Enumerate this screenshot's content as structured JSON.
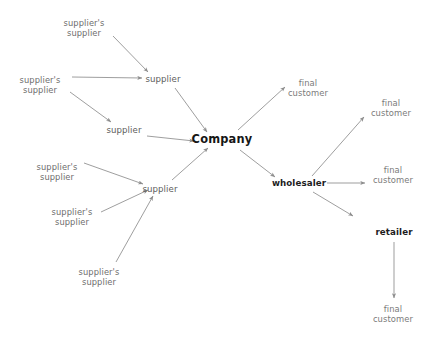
{
  "diagram": {
    "canvas": {
      "width": 430,
      "height": 337,
      "background": "#ffffff"
    },
    "colors": {
      "edge": "#8d8d8d",
      "upstream_text": "#6e6e6e",
      "supplier_text": "#5d5d5d",
      "hub_text": "#161616",
      "mid_text": "#1d1d1d",
      "customer_text": "#7a7a7a"
    },
    "nodes": [
      {
        "id": "ss1",
        "line1": "supplier's",
        "line2": "supplier",
        "x": 84,
        "y": 28,
        "tier": "upstream"
      },
      {
        "id": "ss2",
        "line1": "supplier's",
        "line2": "supplier",
        "x": 40,
        "y": 85,
        "tier": "upstream"
      },
      {
        "id": "ss3",
        "line1": "supplier's",
        "line2": "supplier",
        "x": 57,
        "y": 172,
        "tier": "upstream"
      },
      {
        "id": "ss4",
        "line1": "supplier's",
        "line2": "supplier",
        "x": 72,
        "y": 217,
        "tier": "upstream"
      },
      {
        "id": "ss5",
        "line1": "supplier's",
        "line2": "supplier",
        "x": 99,
        "y": 277,
        "tier": "upstream"
      },
      {
        "id": "s1",
        "line1": "supplier",
        "line2": "",
        "x": 163,
        "y": 79,
        "tier": "supplier"
      },
      {
        "id": "s2",
        "line1": "supplier",
        "line2": "",
        "x": 124,
        "y": 130,
        "tier": "supplier"
      },
      {
        "id": "s3",
        "line1": "supplier",
        "line2": "",
        "x": 160,
        "y": 189,
        "tier": "supplier"
      },
      {
        "id": "co",
        "line1": "Company",
        "line2": "",
        "x": 222,
        "y": 140,
        "tier": "hub"
      },
      {
        "id": "fc1",
        "line1": "final",
        "line2": "customer",
        "x": 308,
        "y": 88,
        "tier": "customer"
      },
      {
        "id": "wh",
        "line1": "wholesaler",
        "line2": "",
        "x": 299,
        "y": 183,
        "tier": "mid"
      },
      {
        "id": "fc2",
        "line1": "final",
        "line2": "customer",
        "x": 391,
        "y": 108,
        "tier": "customer"
      },
      {
        "id": "fc3",
        "line1": "final",
        "line2": "customer",
        "x": 393,
        "y": 175,
        "tier": "customer"
      },
      {
        "id": "rt",
        "line1": "retailer",
        "line2": "",
        "x": 394,
        "y": 232,
        "tier": "mid"
      },
      {
        "id": "fc4",
        "line1": "final",
        "line2": "customer",
        "x": 393,
        "y": 314,
        "tier": "customer"
      }
    ],
    "edges": [
      {
        "id": "e1",
        "from": "ss1",
        "to": "s1",
        "x1": 113,
        "y1": 36,
        "x2": 148,
        "y2": 72
      },
      {
        "id": "e2",
        "from": "ss2",
        "to": "s1",
        "x1": 72,
        "y1": 77,
        "x2": 142,
        "y2": 78
      },
      {
        "id": "e3",
        "from": "ss2",
        "to": "s2",
        "x1": 70,
        "y1": 92,
        "x2": 111,
        "y2": 122
      },
      {
        "id": "e4",
        "from": "s1",
        "to": "co",
        "x1": 175,
        "y1": 88,
        "x2": 207,
        "y2": 132
      },
      {
        "id": "e5",
        "from": "s2",
        "to": "co",
        "x1": 147,
        "y1": 136,
        "x2": 194,
        "y2": 141
      },
      {
        "id": "e6",
        "from": "ss3",
        "to": "s3",
        "x1": 84,
        "y1": 163,
        "x2": 143,
        "y2": 184
      },
      {
        "id": "e7",
        "from": "ss4",
        "to": "s3",
        "x1": 101,
        "y1": 212,
        "x2": 148,
        "y2": 190
      },
      {
        "id": "e8",
        "from": "ss5",
        "to": "s3",
        "x1": 116,
        "y1": 262,
        "x2": 153,
        "y2": 196
      },
      {
        "id": "e9",
        "from": "s3",
        "to": "co",
        "x1": 172,
        "y1": 180,
        "x2": 208,
        "y2": 148
      },
      {
        "id": "e10",
        "from": "co",
        "to": "fc1",
        "x1": 238,
        "y1": 130,
        "x2": 285,
        "y2": 87
      },
      {
        "id": "e11",
        "from": "co",
        "to": "wh",
        "x1": 240,
        "y1": 150,
        "x2": 275,
        "y2": 177
      },
      {
        "id": "e12",
        "from": "wh",
        "to": "fc2",
        "x1": 312,
        "y1": 176,
        "x2": 364,
        "y2": 117
      },
      {
        "id": "e13",
        "from": "wh",
        "to": "fc3",
        "x1": 327,
        "y1": 183,
        "x2": 365,
        "y2": 183
      },
      {
        "id": "e14",
        "from": "wh",
        "to": "rt",
        "x1": 313,
        "y1": 192,
        "x2": 353,
        "y2": 216
      },
      {
        "id": "e15",
        "from": "rt",
        "to": "fc4",
        "x1": 394,
        "y1": 242,
        "x2": 394,
        "y2": 298
      }
    ]
  }
}
